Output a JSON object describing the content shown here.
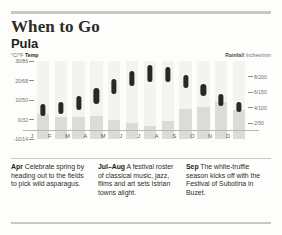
{
  "header": {
    "title": "When to Go",
    "place": "Pula"
  },
  "chart_data": {
    "type": "bar",
    "categories": [
      "J",
      "F",
      "M",
      "A",
      "M",
      "J",
      "J",
      "A",
      "S",
      "O",
      "N",
      "D"
    ],
    "month_labels": [
      "J",
      "F",
      "M",
      "A",
      "M",
      "J",
      "J",
      "A",
      "S",
      "O",
      "N",
      "D"
    ],
    "xlabel": "",
    "grid": false,
    "legend_position": "top",
    "temp_axis": {
      "label": "Temp",
      "units": "°C/°F",
      "ticks": [
        "30/86",
        "20/68",
        "10/50",
        "0/32",
        "-10/14"
      ],
      "tick_values_c": [
        30,
        20,
        10,
        0,
        -10
      ],
      "ylim": [
        -10,
        30
      ]
    },
    "rain_axis": {
      "label": "Rainfall",
      "units": "Inches/mm",
      "ticks": [
        "8/200",
        "6/150",
        "4/100",
        "2/50"
      ],
      "tick_values_mm": [
        200,
        150,
        100,
        50
      ],
      "ylim": [
        0,
        250
      ]
    },
    "series": [
      {
        "name": "Temp",
        "type": "range",
        "units": "°C",
        "low": [
          2,
          3,
          5,
          8,
          13,
          17,
          19,
          19,
          16,
          12,
          7,
          4
        ],
        "high": [
          8,
          9,
          12,
          16,
          21,
          25,
          28,
          27,
          23,
          18,
          13,
          9
        ]
      },
      {
        "name": "Rainfall",
        "type": "bar",
        "units": "mm",
        "values": [
          80,
          70,
          72,
          74,
          62,
          50,
          42,
          58,
          96,
          104,
          118,
          92
        ]
      }
    ]
  },
  "tips": [
    {
      "month": "Apr",
      "text": " Celebrate spring by heading out to the fields to pick wild asparagus."
    },
    {
      "month": "Jul–Aug",
      "text": " A festival roster of classical music, jazz, films and art sets Istrian towns alight."
    },
    {
      "month": "Sep",
      "text": " The white-truffle season kicks off with the Festival of Subotina in Buzet."
    }
  ],
  "colors": {
    "rule": "#c9c9c4",
    "temp_capsule": "#2a2724",
    "rain_bar": "#dcdcd6",
    "column_bg": "#f3f3f0",
    "text": "#231f20"
  }
}
